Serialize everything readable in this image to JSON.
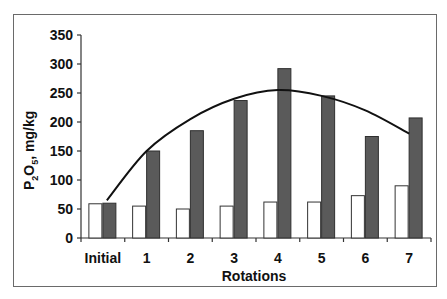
{
  "chart_data": {
    "type": "bar",
    "title": "",
    "xlabel": "Rotations",
    "ylabel": "P2O5, mg/kg",
    "ylabel_parts": {
      "p": "P",
      "sub1": "2",
      "o": "O",
      "sub2": "5",
      "rest": ", mg/kg"
    },
    "categories": [
      "Initial",
      "1",
      "2",
      "3",
      "4",
      "5",
      "6",
      "7"
    ],
    "series": [
      {
        "name": "Series 1 (white)",
        "color": "#ffffff",
        "values": [
          59,
          55,
          50,
          55,
          62,
          62,
          73,
          90
        ]
      },
      {
        "name": "Series 2 (dark)",
        "color": "#5a5a5a",
        "values": [
          60,
          150,
          185,
          237,
          292,
          245,
          175,
          207
        ]
      }
    ],
    "trendline": {
      "type": "polynomial",
      "values": [
        65,
        150,
        205,
        240,
        255,
        245,
        220,
        180
      ]
    },
    "ylim": [
      0,
      350
    ],
    "yticks": [
      0,
      50,
      100,
      150,
      200,
      250,
      300,
      350
    ],
    "grid": false,
    "legend": "none"
  }
}
